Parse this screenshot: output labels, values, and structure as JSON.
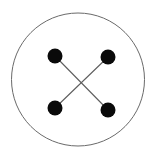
{
  "figure": {
    "canvas": {
      "width": 156,
      "height": 158,
      "background_color": "#ffffff"
    },
    "boundary": {
      "shape_name": "circle-outline",
      "center_x": 78,
      "center_y": 79.5,
      "radius": 66.5,
      "stroke_color": "#6a6a6a",
      "stroke_width": 1,
      "fill_color": "none"
    },
    "nodes": [
      {
        "id": "node-top-left",
        "label": "top-left",
        "cx": 55,
        "cy": 56,
        "r": 7.5,
        "fill_color": "#0a0a0a"
      },
      {
        "id": "node-top-right",
        "label": "top-right",
        "cx": 108,
        "cy": 57,
        "r": 7.5,
        "fill_color": "#0a0a0a"
      },
      {
        "id": "node-bottom-left",
        "label": "bottom-left",
        "cx": 55,
        "cy": 108,
        "r": 7.5,
        "fill_color": "#0a0a0a"
      },
      {
        "id": "node-bottom-right",
        "label": "bottom-right",
        "cx": 108,
        "cy": 110,
        "r": 7.5,
        "fill_color": "#0a0a0a"
      }
    ],
    "edges": [
      {
        "id": "edge-tl-br",
        "label": "top-left to bottom-right",
        "x1": 55,
        "y1": 56,
        "x2": 108,
        "y2": 110,
        "stroke_color": "#5f5f5f",
        "stroke_width": 1.1
      },
      {
        "id": "edge-tr-bl",
        "label": "top-right to bottom-left",
        "x1": 108,
        "y1": 57,
        "x2": 55,
        "y2": 108,
        "stroke_color": "#5f5f5f",
        "stroke_width": 1.1
      }
    ],
    "crossing_point": {
      "x": 81,
      "y": 82
    }
  }
}
